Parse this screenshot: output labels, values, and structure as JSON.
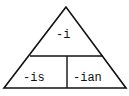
{
  "diagram": {
    "type": "triangle-partition",
    "stroke_color": "#111111",
    "background": "#ffffff",
    "top_section": {
      "label": "-i"
    },
    "bottom_left_section": {
      "label": "-is"
    },
    "bottom_right_section": {
      "label": "-ian"
    }
  }
}
